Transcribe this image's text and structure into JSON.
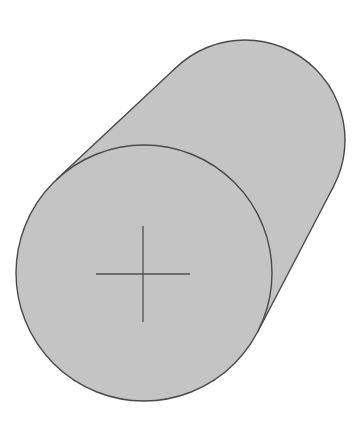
{
  "diagram": {
    "type": "cylinder-oblique-view",
    "colors": {
      "background": "#ffffff",
      "fill": "#c4c4c4",
      "stroke": "#4a4a4a",
      "crosshair": "#505050"
    },
    "back_face": {
      "cx": 245,
      "cy": 140,
      "r": 100
    },
    "front_face": {
      "cx": 144,
      "cy": 273,
      "r": 128
    },
    "crosshair": {
      "cx": 143,
      "cy": 274,
      "h_half": 47,
      "v_half": 48
    }
  }
}
